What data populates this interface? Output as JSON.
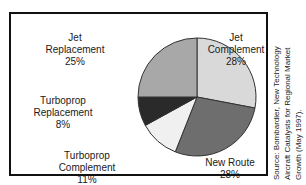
{
  "chart_data": {
    "type": "pie",
    "title": "",
    "subtitle": "",
    "xlabel": "",
    "ylabel": "",
    "legend_position": "none",
    "grid": false,
    "units": "percent",
    "start_angle_deg": 0,
    "direction": "clockwise",
    "categories": [
      "Jet Complement",
      "New Route",
      "Turboprop Complement",
      "Turboprop Replacement",
      "Jet Replacement"
    ],
    "values": [
      28,
      28,
      11,
      8,
      25
    ],
    "slices": [
      {
        "label": "Jet Complement",
        "name_line_1": "Jet",
        "name_line_2": "Complement",
        "value": 28,
        "percent_text": "28%",
        "color": "#d9d9d9"
      },
      {
        "label": "New Route",
        "name_line_1": "New Route",
        "name_line_2": "",
        "value": 28,
        "percent_text": "28%",
        "color": "#6e6e6e"
      },
      {
        "label": "Turboprop Complement",
        "name_line_1": "Turboprop",
        "name_line_2": "Complement",
        "value": 11,
        "percent_text": "11%",
        "color": "#f0f0f0"
      },
      {
        "label": "Turboprop Replacement",
        "name_line_1": "Turboprop",
        "name_line_2": "Replacement",
        "value": 8,
        "percent_text": "8%",
        "color": "#2a2a2a"
      },
      {
        "label": "Jet Replacement",
        "name_line_1": "Jet",
        "name_line_2": "Replacement",
        "value": 25,
        "percent_text": "25%",
        "color": "#a8a8a8"
      }
    ]
  },
  "source_note": {
    "line_1": "Source: Bombardier, New Technology",
    "line_2": "Aircraft Catalysts for Regional Market",
    "line_3": "Growth (May 1997)."
  },
  "colors": {
    "frame": "#111111",
    "slice_outline": "#333333",
    "text": "#1a1a1a",
    "background": "#ffffff"
  }
}
